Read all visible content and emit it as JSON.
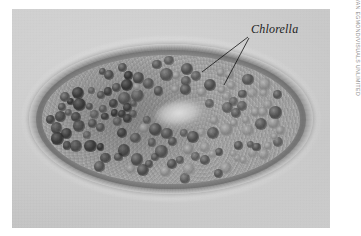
{
  "figure": {
    "kind": "light-micrograph",
    "background_color": "#ffffff",
    "plate_color": "#c9c9c9"
  },
  "annotations": [
    {
      "label": "Chlorella",
      "style": "italic",
      "color": "#1d1d1d",
      "leader_lines": 2
    }
  ],
  "credit": {
    "text": "WIM VAN EGMOND/VISUALS UNLIMITED",
    "orientation": "vertical",
    "color": "#8b8b8b"
  },
  "cell": {
    "outline_shape": "ellipse",
    "organelles": [
      {
        "name": "pellicle",
        "appearance": "thick translucent rim"
      },
      {
        "name": "cilia",
        "appearance": "fine fringe at margin"
      },
      {
        "name": "macronucleus",
        "appearance": "clear pale oval near centre"
      },
      {
        "name": "chlorella-symbionts",
        "appearance": "dense dark spheres filling cytoplasm"
      }
    ]
  },
  "algae_distribution": {
    "count": 132,
    "note": "denser and darker at the left pole, paler toward the right pole"
  }
}
